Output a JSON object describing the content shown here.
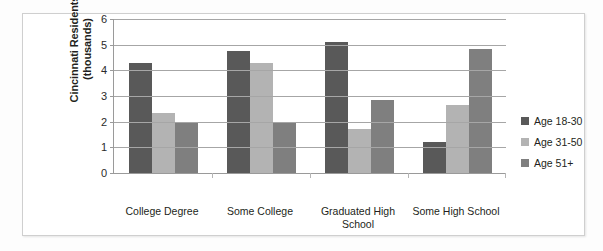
{
  "chart_data": {
    "type": "bar",
    "title": "",
    "xlabel": "",
    "ylabel": "Cincinnati Residents (thousands)",
    "ylabel_line1": "Cincinnati Residents",
    "ylabel_line2": "(thousands)",
    "categories": [
      "College Degree",
      "Some College",
      "Graduated High School",
      "Some High School"
    ],
    "ylim": [
      0,
      6
    ],
    "yticks": [
      0,
      1,
      2,
      3,
      4,
      5,
      6
    ],
    "ytick_labels": [
      "0",
      "1",
      "2",
      "3",
      "4",
      "5",
      "6"
    ],
    "grid": true,
    "legend_position": "right",
    "series": [
      {
        "name": "Age 18-30",
        "color": "#595959",
        "values": [
          4.3,
          4.75,
          5.1,
          1.2
        ]
      },
      {
        "name": "Age 31-50",
        "color": "#b3b3b3",
        "values": [
          2.35,
          4.3,
          1.7,
          2.65
        ]
      },
      {
        "name": "Age 51+",
        "color": "#7f7f7f",
        "values": [
          1.95,
          1.95,
          2.85,
          4.85
        ]
      }
    ]
  }
}
